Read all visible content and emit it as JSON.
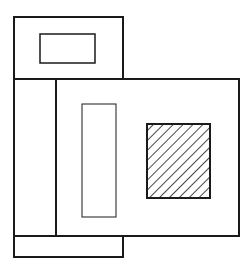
{
  "diagram": {
    "title": "",
    "stroke_color": "#1a1a1a",
    "background": "#ffffff",
    "shapes": [
      {
        "id": "top-box",
        "x": 14,
        "y": 17,
        "w": 109,
        "h": 62,
        "stroke": 2
      },
      {
        "id": "top-inner-rect",
        "x": 40,
        "y": 34,
        "w": 55,
        "h": 29,
        "stroke": 1.5
      },
      {
        "id": "left-column",
        "x": 14,
        "y": 79,
        "w": 42,
        "h": 157,
        "stroke": 2
      },
      {
        "id": "main-box",
        "x": 56,
        "y": 79,
        "w": 183,
        "h": 157,
        "stroke": 2
      },
      {
        "id": "tall-inner-rect",
        "x": 82,
        "y": 104,
        "w": 34,
        "h": 113,
        "stroke": 1
      },
      {
        "id": "hatched-square",
        "x": 147,
        "y": 124,
        "w": 63,
        "h": 74,
        "stroke": 2,
        "fill": "diagonal-hatch"
      },
      {
        "id": "bottom-strip",
        "x": 14,
        "y": 236,
        "w": 109,
        "h": 21,
        "stroke": 2
      }
    ],
    "hatch": {
      "spacing": 7,
      "angle": 45
    }
  }
}
